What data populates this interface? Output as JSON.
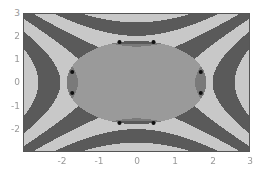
{
  "chart_data": {
    "type": "heatmap",
    "title": "",
    "xlabel": "",
    "ylabel": "",
    "xlim": [
      -3,
      3
    ],
    "ylim": [
      -3,
      3
    ],
    "x_ticks": [
      "-2",
      "-1",
      "0",
      "1",
      "2",
      "3"
    ],
    "y_ticks": [
      "3",
      "2",
      "1",
      "0",
      "-1",
      "-2"
    ],
    "grid": false,
    "legend": null,
    "intersection_points": [
      [
        -0.45,
        1.75
      ],
      [
        0.45,
        1.75
      ],
      [
        -1.7,
        0.45
      ],
      [
        1.7,
        0.45
      ],
      [
        -1.7,
        -0.45
      ],
      [
        1.7,
        -0.45
      ],
      [
        -0.45,
        -1.75
      ],
      [
        0.45,
        -1.75
      ]
    ],
    "colors": {
      "dark_band": "#5a5a5a",
      "light_band": "#c8c8c8",
      "center_region": "#9a9a9a",
      "lens_region": "#7a7a7a",
      "point": "#111111"
    }
  }
}
